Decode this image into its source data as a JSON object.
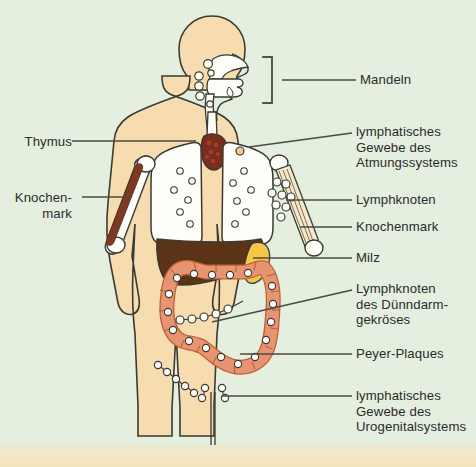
{
  "figure": {
    "background_color": "#e4efdf",
    "bottom_strip_color": "#f6e6c4",
    "text_color": "#2b2b2b",
    "line_color": "#4a4a42"
  },
  "palette": {
    "skin": "#f7dcb0",
    "organ_white": "#fdfdfa",
    "thymus": "#7d2b1c",
    "liver": "#5b3317",
    "spleen": "#f4c64a",
    "intestine": "#e79470",
    "marrow_red": "#7d3a23",
    "node_fill": "#fffef2",
    "outline": "#3a3a32"
  },
  "labels": {
    "left": [
      {
        "id": "thymus",
        "text": "Thymus",
        "x": 8,
        "y": 134,
        "leader": {
          "x1": 72,
          "y1": 141,
          "x2": 196,
          "y2": 141
        }
      },
      {
        "id": "knochenmark-left",
        "text": "Knochen-\nmark",
        "x": 8,
        "y": 190,
        "leader": {
          "x1": 82,
          "y1": 197,
          "x2": 132,
          "y2": 197
        }
      }
    ],
    "right": [
      {
        "id": "mandeln",
        "text": "Mandeln",
        "x": 360,
        "y": 72,
        "leader": {
          "x1": 282,
          "y1": 80,
          "x2": 356,
          "y2": 80
        },
        "bracket": {
          "x": 272,
          "y_top": 57,
          "y_bottom": 103,
          "arm": 10
        }
      },
      {
        "id": "lymph-atmung",
        "text": "lymphatisches\nGewebe des\nAtmungssystems",
        "x": 356,
        "y": 124,
        "leader": {
          "x1": 249,
          "y1": 147,
          "x2": 352,
          "y2": 133
        }
      },
      {
        "id": "lymphknoten",
        "text": "Lymphknoten",
        "x": 356,
        "y": 192,
        "leader": {
          "x1": 286,
          "y1": 200,
          "x2": 352,
          "y2": 200
        }
      },
      {
        "id": "knochenmark-right",
        "text": "Knochenmark",
        "x": 356,
        "y": 219,
        "leader": {
          "x1": 300,
          "y1": 227,
          "x2": 352,
          "y2": 227
        }
      },
      {
        "id": "milz",
        "text": "Milz",
        "x": 356,
        "y": 250,
        "leader": {
          "x1": 253,
          "y1": 258,
          "x2": 352,
          "y2": 258
        }
      },
      {
        "id": "lymphknoten-duenndarm",
        "text": "Lymphknoten\ndes Dünndarm-\ngekröses",
        "x": 356,
        "y": 281,
        "leader": {
          "x1": 212,
          "y1": 322,
          "x2": 352,
          "y2": 290
        }
      },
      {
        "id": "peyer-plaques",
        "text": "Peyer-Plaques",
        "x": 356,
        "y": 346,
        "leader": {
          "x1": 240,
          "y1": 354,
          "x2": 352,
          "y2": 354
        }
      },
      {
        "id": "lymph-urogenital",
        "text": "lymphatisches\nGewebe des\nUrogenitalsystems",
        "x": 356,
        "y": 388,
        "leader": {
          "x1": 222,
          "y1": 396,
          "x2": 352,
          "y2": 396
        }
      }
    ]
  },
  "anatomy": {
    "regions": [
      {
        "name": "head-profile",
        "color": "#f7dcb0"
      },
      {
        "name": "nasal-cavity",
        "color": "#fdfdfa"
      },
      {
        "name": "tonsil-nodes",
        "count": 6,
        "color": "#fffef2"
      },
      {
        "name": "trachea",
        "color": "#fdfdfa"
      },
      {
        "name": "thymus",
        "color": "#7d2b1c"
      },
      {
        "name": "lung-left",
        "color": "#fdfdfa",
        "nodes": 6
      },
      {
        "name": "lung-right",
        "color": "#fdfdfa",
        "nodes": 6
      },
      {
        "name": "humerus-left-marrow",
        "color": "#7d3a23"
      },
      {
        "name": "humerus-right",
        "color": "#fdfdfa"
      },
      {
        "name": "axillary-nodes-right",
        "count": 8,
        "color": "#fffef2"
      },
      {
        "name": "liver",
        "color": "#5b3317"
      },
      {
        "name": "spleen",
        "color": "#f4c64a"
      },
      {
        "name": "large-intestine",
        "color": "#e79470"
      },
      {
        "name": "mesenteric-node-chain",
        "count": 7,
        "color": "#fffef2"
      },
      {
        "name": "inguinal-node-chain-left",
        "count": 5,
        "color": "#fffef2"
      },
      {
        "name": "urogenital-nodes",
        "count": 4,
        "color": "#fffef2"
      }
    ]
  }
}
